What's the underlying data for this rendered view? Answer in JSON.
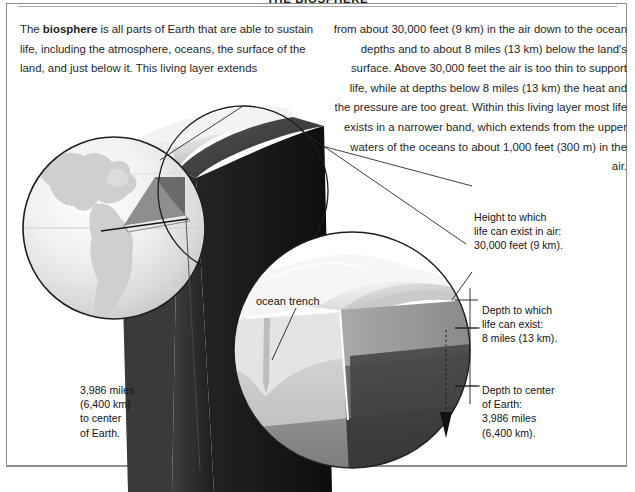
{
  "page": {
    "title": "THE BIOSPHERE",
    "width": 635,
    "height": 492
  },
  "body_text": {
    "left_column": [
      "The biosphere is all parts of Earth that are able to sustain life, including the atmosphere, oceans, the surface of the land, and just below it. This living layer extends"
    ],
    "left_column_runs": {
      "before_bold": "The ",
      "bold": "biosphere",
      "after_bold": " is all parts of Earth that are able to sustain life, including the atmosphere, oceans, the surface of the land, and just below it. This living layer extends"
    },
    "right_column": "from about 30,000 feet (9 km) in the air down to the ocean depths and to about 8 miles (13 km) below the land's surface. Above 30,000 feet the air is too thin to support life, while at depths below 8 miles (13 km) the heat and the pressure are too great. Within this living layer most life exists in a narrower band, which extends from the upper waters of the oceans to about 1,000 feet (300 m) in the air."
  },
  "annotations": {
    "height_air": "Height to which\nlife can exist in air:\n30,000 feet (9 km).",
    "depth_life": "Depth to which\nlife can exist:\n8 miles (13 km).",
    "depth_core": "Depth to center\nof Earth:\n3,986 miles\n(6,400 km).",
    "center_of_earth": "3,986 miles\n(6,400 km)\nto center\nof Earth.",
    "ocean_trench": "ocean trench"
  },
  "figures": {
    "globe": "globe-americas-cutaway",
    "wedge": "earth-wedge-column",
    "detail_circle": "ocean-trench-cross-section",
    "down_arrow": "depth-to-core-arrow"
  },
  "colors": {
    "ink": "#1a1a1a",
    "rule": "#a8a8a8",
    "frame": "#8f8f8f",
    "crust_light": "#e9e9e9",
    "mantle_mid": "#9a9a9a",
    "core_dark": "#3a3a3a",
    "wedge_dark": "#2b2b2b",
    "wedge_darker": "#161616",
    "ocean_pale": "#f2f2f2"
  }
}
